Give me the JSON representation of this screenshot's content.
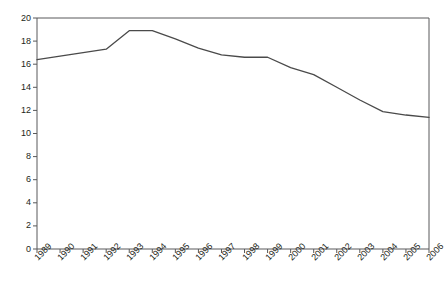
{
  "chart_data": {
    "type": "line",
    "title": "",
    "subtitle": "",
    "xlabel": "",
    "ylabel": "",
    "grid": false,
    "legend": null,
    "legend_position": "none",
    "xlim": [
      1989,
      2006
    ],
    "ylim": [
      0,
      20
    ],
    "ytick_step": 2,
    "yticks": [
      "0",
      "2",
      "4",
      "6",
      "8",
      "10",
      "12",
      "14",
      "16",
      "18",
      "20"
    ],
    "ytick_values": [
      0,
      2,
      4,
      6,
      8,
      10,
      12,
      14,
      16,
      18,
      20
    ],
    "categories": [
      "1989",
      "1990",
      "1991",
      "1992",
      "1993",
      "1994",
      "1995",
      "1996",
      "1997",
      "1998",
      "1999",
      "2000",
      "2001",
      "2002",
      "2003",
      "2004",
      "2005",
      "2006"
    ],
    "x": [
      1989,
      1990,
      1991,
      1992,
      1993,
      1994,
      1995,
      1996,
      1997,
      1998,
      1999,
      2000,
      2001,
      2002,
      2003,
      2004,
      2005,
      2006
    ],
    "values": [
      16.4,
      16.7,
      17.0,
      17.3,
      18.9,
      18.9,
      18.2,
      17.4,
      16.8,
      16.6,
      16.6,
      15.7,
      15.1,
      14.0,
      12.9,
      11.9,
      11.6,
      11.4
    ],
    "series": [
      {
        "name": "series-1",
        "color": "#4a4a4a",
        "values": [
          16.4,
          16.7,
          17.0,
          17.3,
          18.9,
          18.9,
          18.2,
          17.4,
          16.8,
          16.6,
          16.6,
          15.7,
          15.1,
          14.0,
          12.9,
          11.9,
          11.6,
          11.4
        ]
      }
    ],
    "axis_color": "#58595b",
    "line_color": "#4a4a4a",
    "line_width": 1.3,
    "background": "#ffffff"
  },
  "plot_geometry": {
    "left": 37,
    "right": 429,
    "top": 18,
    "bottom": 249
  }
}
